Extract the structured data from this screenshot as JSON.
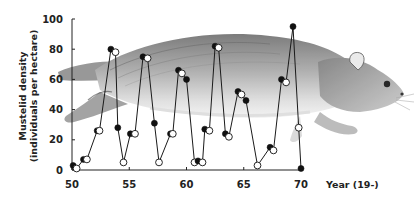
{
  "chart_data": {
    "type": "line",
    "title": "",
    "xlabel": "Year (19-)",
    "ylabel": "Mustelid density (individuals per hectare)",
    "ylabel_lines": [
      "Mustelid density",
      "(individuals per hectare)"
    ],
    "xlim": [
      50,
      70
    ],
    "ylim": [
      0,
      100
    ],
    "x_ticks": [
      50,
      55,
      60,
      65,
      70
    ],
    "y_ticks": [
      0,
      20,
      40,
      60,
      80,
      100
    ],
    "grid": false,
    "legend": null,
    "background_illustration": "weasel (stoat) drawing",
    "marker_note": "alternating filled and open circle markers along a single connected line",
    "series": [
      {
        "name": "Mustelid density",
        "points": [
          {
            "x": 50.1,
            "y": 3,
            "marker": "filled"
          },
          {
            "x": 50.4,
            "y": 1,
            "marker": "open"
          },
          {
            "x": 51.0,
            "y": 7,
            "marker": "filled"
          },
          {
            "x": 51.3,
            "y": 7,
            "marker": "open"
          },
          {
            "x": 52.2,
            "y": 26,
            "marker": "filled"
          },
          {
            "x": 52.4,
            "y": 26,
            "marker": "open"
          },
          {
            "x": 53.4,
            "y": 80,
            "marker": "filled"
          },
          {
            "x": 53.8,
            "y": 78,
            "marker": "open"
          },
          {
            "x": 54.0,
            "y": 28,
            "marker": "filled"
          },
          {
            "x": 54.5,
            "y": 5,
            "marker": "open"
          },
          {
            "x": 55.1,
            "y": 24,
            "marker": "filled"
          },
          {
            "x": 55.5,
            "y": 24,
            "marker": "open"
          },
          {
            "x": 56.2,
            "y": 75,
            "marker": "filled"
          },
          {
            "x": 56.6,
            "y": 74,
            "marker": "open"
          },
          {
            "x": 57.2,
            "y": 31,
            "marker": "filled"
          },
          {
            "x": 57.6,
            "y": 5,
            "marker": "open"
          },
          {
            "x": 58.6,
            "y": 24,
            "marker": "filled"
          },
          {
            "x": 58.8,
            "y": 24,
            "marker": "open"
          },
          {
            "x": 59.3,
            "y": 66,
            "marker": "filled"
          },
          {
            "x": 59.6,
            "y": 64,
            "marker": "open"
          },
          {
            "x": 60.0,
            "y": 60,
            "marker": "filled"
          },
          {
            "x": 60.7,
            "y": 5,
            "marker": "open"
          },
          {
            "x": 61.0,
            "y": 6,
            "marker": "filled"
          },
          {
            "x": 61.4,
            "y": 5,
            "marker": "open"
          },
          {
            "x": 61.6,
            "y": 27,
            "marker": "filled"
          },
          {
            "x": 62.0,
            "y": 26,
            "marker": "open"
          },
          {
            "x": 62.5,
            "y": 82,
            "marker": "filled"
          },
          {
            "x": 62.8,
            "y": 81,
            "marker": "open"
          },
          {
            "x": 63.4,
            "y": 24,
            "marker": "filled"
          },
          {
            "x": 63.7,
            "y": 22,
            "marker": "open"
          },
          {
            "x": 64.5,
            "y": 52,
            "marker": "filled"
          },
          {
            "x": 64.8,
            "y": 50,
            "marker": "open"
          },
          {
            "x": 65.2,
            "y": 46,
            "marker": "filled"
          },
          {
            "x": 66.2,
            "y": 3,
            "marker": "open"
          },
          {
            "x": 67.3,
            "y": 15,
            "marker": "filled"
          },
          {
            "x": 67.6,
            "y": 13,
            "marker": "open"
          },
          {
            "x": 68.3,
            "y": 60,
            "marker": "filled"
          },
          {
            "x": 68.7,
            "y": 58,
            "marker": "open"
          },
          {
            "x": 69.3,
            "y": 95,
            "marker": "filled"
          },
          {
            "x": 69.8,
            "y": 28,
            "marker": "open"
          },
          {
            "x": 70.0,
            "y": 1,
            "marker": "filled"
          }
        ]
      }
    ]
  },
  "layout": {
    "plot_left": 72,
    "plot_right": 301,
    "plot_top": 19,
    "plot_bottom": 170,
    "line_color": "#1a1a1a",
    "marker_fill": "#111111",
    "marker_open_fill": "#ffffff"
  }
}
